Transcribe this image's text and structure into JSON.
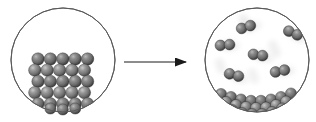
{
  "figure": {
    "type": "science-illustration",
    "width": 316,
    "height": 122,
    "background_color": "#ffffff"
  },
  "colors": {
    "sphere_fill": "#6e6e6e",
    "sphere_dark": "#3d3d3d",
    "sphere_highlight": "#bfbfbf",
    "circle_stroke": "#5a5a5a",
    "arrow_stroke": "#1a1a1a",
    "blur_streak": "#d9d9d9",
    "background": "#ffffff"
  },
  "left_panel": {
    "name": "solid-state-container",
    "label": "solid",
    "circle": {
      "cx": 63,
      "cy": 60,
      "r": 52,
      "stroke_width": 1
    },
    "lattice": {
      "name": "crystal-lattice",
      "state": "solid",
      "columns": 5,
      "rows": 5,
      "sphere_radius": 6.2,
      "spacing_x": 12.4,
      "spacing_y": 11.2,
      "origin_x": 38,
      "origin_y": 59,
      "row_offset_x": 3.2,
      "description": "close-packed ordered array of spheres"
    }
  },
  "arrow": {
    "name": "process-arrow",
    "direction": "right",
    "x1": 124,
    "x2": 197,
    "y": 62,
    "stroke_width": 1,
    "head_length": 11,
    "head_width": 7,
    "label": ""
  },
  "right_panel": {
    "name": "gas-state-container",
    "label": "gas over liquid",
    "circle": {
      "cx": 257,
      "cy": 60,
      "r": 52,
      "stroke_width": 1
    },
    "gas_molecules": {
      "name": "gas-molecule-group",
      "state": "gas",
      "sphere_radius": 5.4,
      "count": 6,
      "items": [
        {
          "x": 246,
          "y": 27,
          "rot": -18,
          "blur_dx": 13,
          "blur_dy": -11
        },
        {
          "x": 293,
          "y": 33,
          "rot": 24,
          "blur_dx": 11,
          "blur_dy": -10
        },
        {
          "x": 225,
          "y": 45,
          "rot": -5,
          "blur_dx": 12,
          "blur_dy": -9
        },
        {
          "x": 258,
          "y": 55,
          "rot": 8,
          "blur_dx": 13,
          "blur_dy": -11
        },
        {
          "x": 280,
          "y": 71,
          "rot": -12,
          "blur_dx": 12,
          "blur_dy": -10
        },
        {
          "x": 234,
          "y": 75,
          "rot": 15,
          "blur_dx": 12,
          "blur_dy": -10
        }
      ]
    },
    "condensed_layer": {
      "name": "liquid-pool",
      "state": "condensed",
      "sphere_radius": 5.6,
      "count": 21,
      "description": "curved pool of spheres resting along bottom of flask"
    }
  }
}
